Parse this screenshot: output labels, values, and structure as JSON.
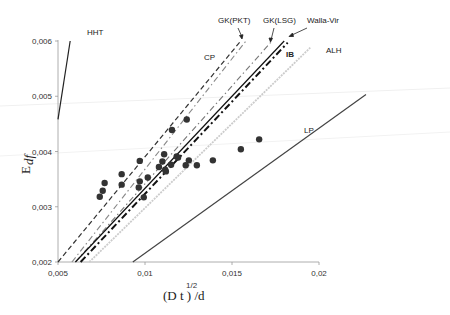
{
  "chart_data": {
    "type": "scatter",
    "title": "",
    "xlabel": "(D t)^1/2 /d",
    "xlabel_main": "(D t ) /d",
    "xlabel_sup": "1/2",
    "ylabel": "E_df",
    "ylabel_main": "E",
    "ylabel_sub": "df",
    "xlim": [
      0.005,
      0.02
    ],
    "ylim": [
      0.002,
      0.006
    ],
    "grid": false,
    "x_ticks": [
      "0,005",
      "0,01",
      "0,015",
      "0,02"
    ],
    "y_ticks": [
      "0,002",
      "0,003",
      "0,004",
      "0,005",
      "0,006"
    ],
    "series": [
      {
        "name": "Experimental data",
        "kind": "points",
        "color": "#333333",
        "x": [
          0.0074,
          0.00757,
          0.00768,
          0.00866,
          0.00866,
          0.0097,
          0.0097,
          0.00964,
          0.00993,
          0.01016,
          0.0108,
          0.011,
          0.0111,
          0.01116,
          0.0112,
          0.01155,
          0.01182,
          0.0119,
          0.0115,
          0.0124,
          0.01234,
          0.01252,
          0.01298,
          0.0139,
          0.01551,
          0.01656
        ],
        "y": [
          0.00318,
          0.00329,
          0.00343,
          0.00359,
          0.0034,
          0.00383,
          0.00346,
          0.00335,
          0.00317,
          0.00353,
          0.00372,
          0.00382,
          0.00395,
          0.00367,
          0.00364,
          0.00439,
          0.00391,
          0.00389,
          0.00376,
          0.00458,
          0.00375,
          0.00384,
          0.00375,
          0.00384,
          0.00404,
          0.00422
        ]
      },
      {
        "name": "HHT",
        "kind": "line",
        "style": "solid",
        "color": "#222222",
        "x": [
          0.005,
          0.0057
        ],
        "y": [
          0.00458,
          0.006
        ]
      },
      {
        "name": "CP",
        "kind": "line",
        "style": "dashed",
        "color": "#333333",
        "x": [
          0.005,
          0.0155
        ],
        "y": [
          0.002,
          0.006
        ]
      },
      {
        "name": "GK(PKT)",
        "kind": "line",
        "style": "dash-dot",
        "color": "#888888",
        "x": [
          0.0058,
          0.0158
        ],
        "y": [
          0.002,
          0.006
        ]
      },
      {
        "name": "GK(LSG)",
        "kind": "line",
        "style": "dash-dot",
        "color": "#777777",
        "x": [
          0.006,
          0.0173
        ],
        "y": [
          0.002,
          0.006
        ]
      },
      {
        "name": "Walla-Vir",
        "kind": "line",
        "style": "solid",
        "color": "#111111",
        "x": [
          0.006,
          0.018
        ],
        "y": [
          0.002,
          0.006
        ]
      },
      {
        "name": "IB",
        "kind": "line",
        "style": "thick-dash-dot",
        "color": "#111111",
        "x": [
          0.0063,
          0.0182
        ],
        "y": [
          0.002,
          0.00597
        ]
      },
      {
        "name": "ALH",
        "kind": "line",
        "style": "dotted-light",
        "color": "#cccccc",
        "x": [
          0.0068,
          0.0195
        ],
        "y": [
          0.002,
          0.00588
        ]
      },
      {
        "name": "LP",
        "kind": "line",
        "style": "solid",
        "color": "#444444",
        "x": [
          0.0093,
          0.0227
        ],
        "y": [
          0.002,
          0.00503
        ]
      }
    ],
    "annotations": [
      "HHT",
      "CP",
      "GK(PKT)",
      "GK(LSG)",
      "Walla-Vir",
      "IB",
      "ALH",
      "LP"
    ]
  },
  "labels": {
    "hht": "HHT",
    "cp": "CP",
    "gkpkt": "GK(PKT)",
    "gklsg": "GK(LSG)",
    "walla": "Walla-Vir",
    "ib": "IB",
    "alh": "ALH",
    "lp": "LP"
  }
}
